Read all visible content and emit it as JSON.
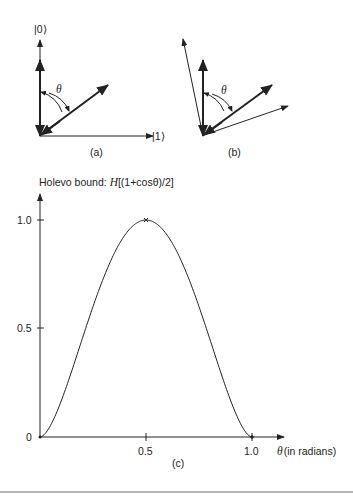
{
  "colors": {
    "ink": "#222222",
    "background": "#ffffff",
    "separator": "#9a9a9a"
  },
  "panel_a": {
    "caption": "(a)",
    "axis_labels": {
      "up": "|0⟩",
      "right": "|1⟩"
    },
    "angle_label": "θ"
  },
  "panel_b": {
    "caption": "(b)",
    "angle_label": "θ"
  },
  "panel_c": {
    "caption": "(c)",
    "title_prefix": "Holevo bound: ",
    "title_italic": "H",
    "title_suffix": "[(1+cosθ)/2]",
    "x_axis_symbol": "θ",
    "x_axis_label": "(in radians)",
    "y_ticks": [
      "0",
      "0.5",
      "1.0"
    ],
    "x_ticks": [
      "0.5",
      "1.0"
    ]
  },
  "chart_data": {
    "type": "line",
    "title": "Holevo bound: H[(1+cosθ)/2]",
    "xlabel": "θ (in radians)",
    "ylabel": "",
    "xlim": [
      0,
      1.1
    ],
    "ylim": [
      0,
      1.0
    ],
    "grid": false,
    "x_ticks": [
      0.5,
      1.0
    ],
    "y_ticks": [
      0,
      0.5,
      1.0
    ],
    "series": [
      {
        "name": "H[(1+cosθ)/2]",
        "x": [
          0,
          0.05,
          0.1,
          0.15,
          0.2,
          0.25,
          0.3,
          0.35,
          0.4,
          0.45,
          0.5,
          0.55,
          0.6,
          0.65,
          0.7,
          0.75,
          0.8,
          0.85,
          0.9,
          0.95,
          1.0
        ],
        "values": [
          0,
          0.04,
          0.14,
          0.27,
          0.42,
          0.6,
          0.74,
          0.86,
          0.94,
          0.99,
          1.0,
          0.99,
          0.94,
          0.86,
          0.74,
          0.6,
          0.42,
          0.27,
          0.14,
          0.04,
          0
        ]
      }
    ],
    "annotations": [
      {
        "x": 0.5,
        "y": 1.0,
        "marker": "x"
      }
    ]
  }
}
